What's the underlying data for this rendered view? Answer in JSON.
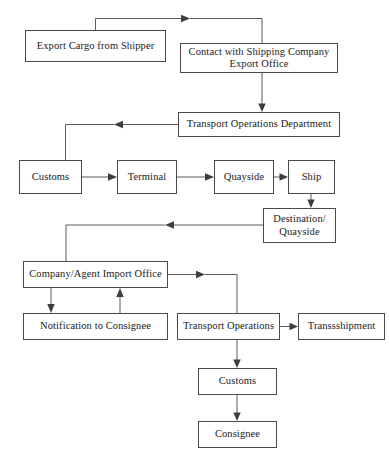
{
  "diagram": {
    "type": "flowchart",
    "background_color": "#ffffff",
    "box_border_color": "#4a4a4a",
    "connector_color": "#5a5a5a",
    "text_color": "#1a1a1a"
  },
  "nodes": [
    {
      "id": "export-cargo-from-shipper",
      "label": "Export Cargo from Shipper",
      "x": 25,
      "y": 30,
      "w": 141,
      "h": 32
    },
    {
      "id": "contact-with-shipping-company-export-office",
      "label": "Contact with Shipping Company Export Office",
      "line1": "Contact with Shipping Company",
      "line2": "Export Office",
      "x": 180,
      "y": 43,
      "w": 158,
      "h": 30
    },
    {
      "id": "transport-operations-department",
      "label": "Transport Operations Department",
      "x": 178,
      "y": 112,
      "w": 162,
      "h": 25
    },
    {
      "id": "customs-export",
      "label": "Customs",
      "x": 19,
      "y": 160,
      "w": 63,
      "h": 34
    },
    {
      "id": "terminal",
      "label": "Terminal",
      "x": 117,
      "y": 160,
      "w": 60,
      "h": 34
    },
    {
      "id": "quayside",
      "label": "Quayside",
      "x": 214,
      "y": 160,
      "w": 60,
      "h": 34
    },
    {
      "id": "ship",
      "label": "Ship",
      "x": 288,
      "y": 160,
      "w": 47,
      "h": 34
    },
    {
      "id": "destination-quayside",
      "label": "Destination/ Quayside",
      "line1": "Destination/",
      "line2": "Quayside",
      "x": 263,
      "y": 208,
      "w": 73,
      "h": 35
    },
    {
      "id": "company-agent-import-office",
      "label": "Company/Agent Import Office",
      "x": 23,
      "y": 261,
      "w": 145,
      "h": 27
    },
    {
      "id": "notification-to-consignee",
      "label": "Notification to Consignee",
      "x": 23,
      "y": 313,
      "w": 145,
      "h": 27
    },
    {
      "id": "transport-operations",
      "label": "Transport Operations",
      "x": 177,
      "y": 313,
      "w": 103,
      "h": 27
    },
    {
      "id": "transsshipment",
      "label": "Transsshipment",
      "x": 298,
      "y": 313,
      "w": 87,
      "h": 27
    },
    {
      "id": "customs-import",
      "label": "Customs",
      "x": 198,
      "y": 368,
      "w": 79,
      "h": 27
    },
    {
      "id": "consignee",
      "label": "Consignee",
      "x": 198,
      "y": 421,
      "w": 79,
      "h": 27
    }
  ],
  "edges": [
    {
      "id": "edge-export-cargo-to-top-rail",
      "from": "export-cargo-from-shipper",
      "to": "contact-with-shipping-company-export-office",
      "arrow": "right"
    },
    {
      "id": "edge-contact-to-transport-operations-department",
      "from": "contact-with-shipping-company-export-office",
      "to": "transport-operations-department",
      "arrow": "down"
    },
    {
      "id": "edge-transport-operations-department-to-customs",
      "from": "transport-operations-department",
      "to": "customs-export",
      "arrow": "left"
    },
    {
      "id": "edge-customs-to-terminal",
      "from": "customs-export",
      "to": "terminal",
      "arrow": "right"
    },
    {
      "id": "edge-terminal-to-quayside",
      "from": "terminal",
      "to": "quayside",
      "arrow": "right"
    },
    {
      "id": "edge-quayside-to-ship",
      "from": "quayside",
      "to": "ship",
      "arrow": "right"
    },
    {
      "id": "edge-ship-to-destination-quayside",
      "from": "ship",
      "to": "destination-quayside",
      "arrow": "down"
    },
    {
      "id": "edge-destination-quayside-to-company-agent-import-office",
      "from": "destination-quayside",
      "to": "company-agent-import-office",
      "arrow": "left"
    },
    {
      "id": "edge-company-agent-to-notification",
      "from": "company-agent-import-office",
      "to": "notification-to-consignee",
      "arrow": "down"
    },
    {
      "id": "edge-notification-to-company-agent",
      "from": "notification-to-consignee",
      "to": "company-agent-import-office",
      "arrow": "up"
    },
    {
      "id": "edge-company-agent-to-transport-operations",
      "from": "company-agent-import-office",
      "to": "transport-operations",
      "arrow": "right"
    },
    {
      "id": "edge-transport-operations-to-transsshipment",
      "from": "transport-operations",
      "to": "transsshipment",
      "arrow": "right"
    },
    {
      "id": "edge-transport-operations-to-customs-import",
      "from": "transport-operations",
      "to": "customs-import",
      "arrow": "down"
    },
    {
      "id": "edge-customs-import-to-consignee",
      "from": "customs-import",
      "to": "consignee",
      "arrow": "down"
    }
  ]
}
